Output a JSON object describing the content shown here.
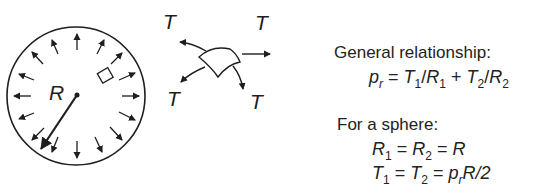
{
  "diagram": {
    "sphere": {
      "radius_label": "R"
    },
    "shell_element": {
      "tension_labels": [
        "T",
        "T",
        "T",
        "T"
      ]
    }
  },
  "text": {
    "general_heading": "General relationship:",
    "general_eq": {
      "lhs": "p",
      "lhs_sub": "r",
      "t1": "T",
      "t1_sub": "1",
      "r1": "R",
      "r1_sub": "1",
      "t2": "T",
      "t2_sub": "2",
      "r2": "R",
      "r2_sub": "2"
    },
    "sphere_heading": "For a sphere:",
    "sphere_eq1": {
      "a": "R",
      "a_sub": "1",
      "b": "R",
      "b_sub": "2",
      "c": "R"
    },
    "sphere_eq2": {
      "a": "T",
      "a_sub": "1",
      "b": "T",
      "b_sub": "2",
      "c": "p",
      "c_sub": "r",
      "d": "R/2"
    }
  },
  "colors": {
    "ink": "#1e1e1e",
    "background": "#ffffff"
  }
}
